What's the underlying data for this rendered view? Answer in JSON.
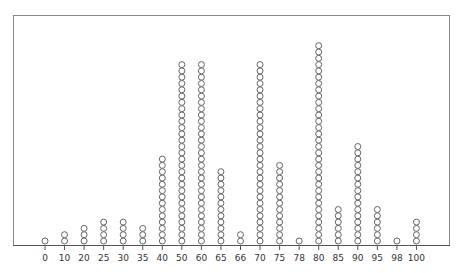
{
  "chart_data": {
    "type": "dot",
    "title": "",
    "xlabel": "",
    "ylabel": "",
    "categories": [
      "0",
      "10",
      "20",
      "25",
      "30",
      "35",
      "40",
      "50",
      "60",
      "65",
      "66",
      "70",
      "75",
      "78",
      "80",
      "85",
      "90",
      "95",
      "98",
      "100"
    ],
    "values": [
      1,
      2,
      3,
      4,
      4,
      3,
      14,
      29,
      29,
      12,
      2,
      29,
      13,
      1,
      32,
      6,
      16,
      6,
      1,
      4
    ],
    "grid": false,
    "legend": null,
    "frame": true,
    "marker": "open-circle",
    "colors": {
      "axis": "#555555",
      "frame": "#888888",
      "marker_stroke": "#555555",
      "marker_fill": "#ffffff"
    }
  }
}
